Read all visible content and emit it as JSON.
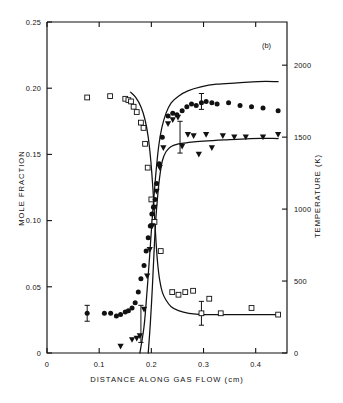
{
  "figure": {
    "panel_label": "(b)",
    "background_color": "#ffffff",
    "ink_color": "#111111"
  },
  "chart_data": {
    "type": "scatter",
    "title": "",
    "subtitle": "",
    "panel": "(b)",
    "xlabel": "DISTANCE ALONG GAS FLOW (cm)",
    "ylabel": "MOLE FRACTION",
    "y2label": "TEMPERATURE (K)",
    "xlim": [
      0,
      0.46
    ],
    "ylim": [
      0,
      0.25
    ],
    "y2lim": [
      0,
      2300
    ],
    "grid": false,
    "legend": "none",
    "xticks": [
      0,
      0.1,
      0.2,
      0.3,
      0.4
    ],
    "xticklabels": [
      "0",
      "0.1",
      "0.2",
      "0.3",
      "0.4"
    ],
    "yticks": [
      0,
      0.05,
      0.1,
      0.15,
      0.2,
      0.25
    ],
    "yticklabels": [
      "0",
      "0.05",
      "0.10",
      "0.15",
      "0.20",
      "0.25"
    ],
    "y2ticks": [
      0,
      500,
      1000,
      1500,
      2000
    ],
    "y2ticklabels": [
      "0",
      "500",
      "1000",
      "1500",
      "2000"
    ],
    "series": [
      {
        "name": "open-squares-reactant-mole-fraction",
        "marker": "open-square",
        "axis": "left",
        "points": [
          [
            0.077,
            0.193
          ],
          [
            0.121,
            0.194
          ],
          [
            0.15,
            0.192
          ],
          [
            0.156,
            0.191
          ],
          [
            0.161,
            0.19
          ],
          [
            0.166,
            0.186
          ],
          [
            0.172,
            0.182
          ],
          [
            0.18,
            0.174
          ],
          [
            0.185,
            0.17
          ],
          [
            0.188,
            0.158
          ],
          [
            0.193,
            0.14
          ],
          [
            0.2,
            0.116
          ],
          [
            0.206,
            0.099
          ],
          [
            0.218,
            0.077
          ],
          [
            0.24,
            0.046
          ],
          [
            0.252,
            0.044
          ],
          [
            0.265,
            0.046
          ],
          [
            0.28,
            0.047
          ],
          [
            0.296,
            0.03
          ],
          [
            0.311,
            0.041
          ],
          [
            0.333,
            0.03
          ],
          [
            0.392,
            0.034
          ],
          [
            0.443,
            0.029
          ]
        ],
        "errorbars": [
          {
            "x": 0.296,
            "y": 0.03,
            "err": 0.009
          }
        ]
      },
      {
        "name": "filled-circles-product-mole-fraction",
        "marker": "filled-circle",
        "axis": "left",
        "points": [
          [
            0.077,
            0.03
          ],
          [
            0.11,
            0.03
          ],
          [
            0.122,
            0.03
          ],
          [
            0.133,
            0.028
          ],
          [
            0.141,
            0.029
          ],
          [
            0.15,
            0.031
          ],
          [
            0.156,
            0.032
          ],
          [
            0.163,
            0.034
          ],
          [
            0.169,
            0.038
          ],
          [
            0.175,
            0.046
          ],
          [
            0.18,
            0.056
          ],
          [
            0.186,
            0.066
          ],
          [
            0.19,
            0.077
          ],
          [
            0.194,
            0.087
          ],
          [
            0.198,
            0.096
          ],
          [
            0.201,
            0.105
          ],
          [
            0.204,
            0.11
          ],
          [
            0.207,
            0.116
          ],
          [
            0.21,
            0.128
          ],
          [
            0.215,
            0.143
          ],
          [
            0.221,
            0.163
          ],
          [
            0.232,
            0.179
          ],
          [
            0.241,
            0.181
          ],
          [
            0.249,
            0.18
          ],
          [
            0.259,
            0.183
          ],
          [
            0.268,
            0.186
          ],
          [
            0.277,
            0.188
          ],
          [
            0.286,
            0.187
          ],
          [
            0.296,
            0.189
          ],
          [
            0.305,
            0.19
          ],
          [
            0.316,
            0.189
          ],
          [
            0.326,
            0.188
          ],
          [
            0.348,
            0.189
          ],
          [
            0.37,
            0.187
          ],
          [
            0.392,
            0.186
          ],
          [
            0.414,
            0.185
          ],
          [
            0.443,
            0.183
          ]
        ],
        "errorbars": [
          {
            "x": 0.077,
            "y": 0.03,
            "err": 0.006
          },
          {
            "x": 0.296,
            "y": 0.19,
            "err": 0.006
          }
        ]
      },
      {
        "name": "filled-triangles-temperature",
        "marker": "filled-triangle-down",
        "axis": "right",
        "points": [
          [
            0.141,
            0.005
          ],
          [
            0.163,
            0.01
          ],
          [
            0.172,
            0.011
          ],
          [
            0.178,
            0.013
          ],
          [
            0.186,
            0.033
          ],
          [
            0.192,
            0.058
          ],
          [
            0.197,
            0.078
          ],
          [
            0.202,
            0.096
          ],
          [
            0.206,
            0.11
          ],
          [
            0.21,
            0.122
          ],
          [
            0.216,
            0.14
          ],
          [
            0.223,
            0.155
          ],
          [
            0.232,
            0.173
          ],
          [
            0.241,
            0.176
          ],
          [
            0.251,
            0.178
          ],
          [
            0.259,
            0.156
          ],
          [
            0.27,
            0.165
          ],
          [
            0.281,
            0.164
          ],
          [
            0.291,
            0.15
          ],
          [
            0.305,
            0.165
          ],
          [
            0.316,
            0.155
          ],
          [
            0.337,
            0.164
          ],
          [
            0.359,
            0.163
          ],
          [
            0.381,
            0.163
          ],
          [
            0.414,
            0.163
          ],
          [
            0.443,
            0.165
          ]
        ],
        "errorbars": [
          {
            "x": 0.18,
            "y": 0.022,
            "err": 0.014
          },
          {
            "x": 0.255,
            "y": 0.163,
            "err": 0.012
          }
        ]
      }
    ],
    "model_curves": [
      {
        "name": "reactant-decay-curve",
        "description": "monotonic decay of open-square species from ~0.20 to ~0.028",
        "points": [
          [
            0.16,
            0.197
          ],
          [
            0.17,
            0.193
          ],
          [
            0.18,
            0.186
          ],
          [
            0.188,
            0.176
          ],
          [
            0.194,
            0.163
          ],
          [
            0.199,
            0.145
          ],
          [
            0.203,
            0.124
          ],
          [
            0.206,
            0.104
          ],
          [
            0.209,
            0.084
          ],
          [
            0.212,
            0.068
          ],
          [
            0.216,
            0.055
          ],
          [
            0.221,
            0.046
          ],
          [
            0.228,
            0.04
          ],
          [
            0.238,
            0.035
          ],
          [
            0.252,
            0.032
          ],
          [
            0.272,
            0.03
          ],
          [
            0.3,
            0.029
          ],
          [
            0.35,
            0.029
          ],
          [
            0.4,
            0.029
          ],
          [
            0.443,
            0.029
          ]
        ]
      },
      {
        "name": "product-rise-curve",
        "description": "sigmoid rise of filled-circle species to ~0.205",
        "points": [
          [
            0.178,
            0.0
          ],
          [
            0.186,
            0.02
          ],
          [
            0.192,
            0.048
          ],
          [
            0.197,
            0.075
          ],
          [
            0.201,
            0.098
          ],
          [
            0.205,
            0.118
          ],
          [
            0.209,
            0.137
          ],
          [
            0.214,
            0.156
          ],
          [
            0.22,
            0.17
          ],
          [
            0.228,
            0.181
          ],
          [
            0.238,
            0.189
          ],
          [
            0.252,
            0.194
          ],
          [
            0.27,
            0.198
          ],
          [
            0.295,
            0.201
          ],
          [
            0.325,
            0.203
          ],
          [
            0.365,
            0.204
          ],
          [
            0.405,
            0.205
          ],
          [
            0.443,
            0.205
          ]
        ]
      },
      {
        "name": "temperature-rise-curve",
        "description": "sigmoid rise of temperature to ~1600 K",
        "points": [
          [
            0.194,
            0.0
          ],
          [
            0.198,
            0.022
          ],
          [
            0.202,
            0.05
          ],
          [
            0.205,
            0.075
          ],
          [
            0.208,
            0.098
          ],
          [
            0.212,
            0.118
          ],
          [
            0.216,
            0.133
          ],
          [
            0.221,
            0.145
          ],
          [
            0.228,
            0.152
          ],
          [
            0.238,
            0.156
          ],
          [
            0.252,
            0.158
          ],
          [
            0.272,
            0.159
          ],
          [
            0.3,
            0.16
          ],
          [
            0.34,
            0.161
          ],
          [
            0.39,
            0.162
          ],
          [
            0.443,
            0.162
          ]
        ]
      }
    ]
  }
}
